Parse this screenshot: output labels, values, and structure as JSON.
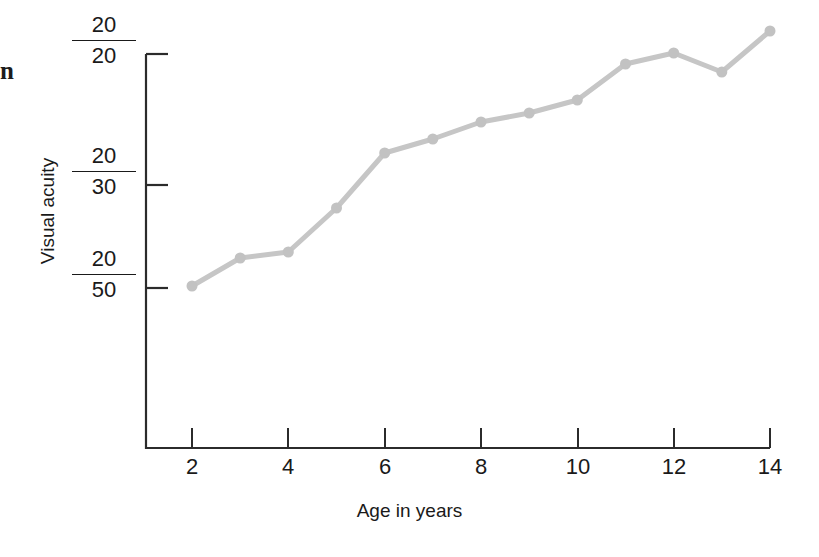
{
  "page": {
    "background_color": "#ffffff",
    "margin_glyph": "n"
  },
  "axis_titles": {
    "x": "Age in years",
    "y": "Visual acuity"
  },
  "chart_data": {
    "type": "line",
    "title": "",
    "subtitle": "",
    "xlabel": "Age in years",
    "ylabel": "Visual acuity",
    "x": [
      2,
      3,
      4,
      5,
      6,
      7,
      8,
      9,
      10,
      11,
      12,
      13,
      14
    ],
    "x_tick_labels": [
      "2",
      "4",
      "6",
      "8",
      "10",
      "12",
      "14"
    ],
    "x_tick_values": [
      2,
      4,
      6,
      8,
      10,
      12,
      14
    ],
    "xlim": [
      1.4,
      14.6
    ],
    "y_tick_labels": [
      "20/20",
      "20/30",
      "20/50"
    ],
    "y_tick_numerators": [
      "20",
      "20",
      "20"
    ],
    "y_tick_denominators": [
      "20",
      "30",
      "50"
    ],
    "y_tick_positions_px": [
      54,
      185,
      288
    ],
    "values_px_y": [
      286,
      258,
      252,
      208,
      153,
      139,
      122,
      113,
      100,
      64,
      53,
      72,
      31
    ],
    "values_snellen": [
      "20/50",
      "20/44",
      "20/43",
      "20/38",
      "20/32",
      "20/31",
      "20/29",
      "20/28",
      "20/27",
      "20/23",
      "20/22",
      "20/24",
      "20/20"
    ],
    "grid": false,
    "legend": false,
    "legend_position": "none",
    "series": [
      {
        "name": "Visual acuity",
        "color": "#c6c6c6",
        "marker": "circle",
        "values": [
          286,
          258,
          252,
          208,
          153,
          139,
          122,
          113,
          100,
          64,
          53,
          72,
          31
        ]
      }
    ]
  },
  "style": {
    "line_color": "#c6c6c6",
    "marker_color": "#c2c2c2",
    "axis_color": "#2b2b2b",
    "text_color": "#1a1a1a"
  }
}
